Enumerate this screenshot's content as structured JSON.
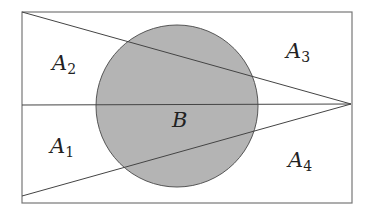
{
  "diagram": {
    "type": "geometric-region-partition",
    "colors": {
      "background": "#ffffff",
      "stroke": "#444444",
      "rect_stroke": "#777777",
      "circle_fill": "#b4b4b4",
      "circle_stroke": "#555555",
      "text": "#222222"
    },
    "rectangle": {
      "x": 22,
      "y": 12,
      "width": 330,
      "height": 191
    },
    "circle": {
      "cx": 177,
      "cy": 106,
      "r": 81
    },
    "apex": {
      "x": 351,
      "y": 104
    },
    "lines": [
      {
        "name": "upper-diagonal",
        "x1": 22,
        "y1": 12,
        "x2": 351,
        "y2": 104
      },
      {
        "name": "horizontal-midline",
        "x1": 22,
        "y1": 105,
        "x2": 351,
        "y2": 104
      },
      {
        "name": "lower-diagonal",
        "x1": 22,
        "y1": 196,
        "x2": 351,
        "y2": 104
      }
    ],
    "labels": {
      "A2": {
        "main": "A",
        "sub": "2",
        "x": 52,
        "y": 70
      },
      "A3": {
        "main": "A",
        "sub": "3",
        "x": 286,
        "y": 58
      },
      "A1": {
        "main": "A",
        "sub": "1",
        "x": 50,
        "y": 153
      },
      "A4": {
        "main": "A",
        "sub": "4",
        "x": 288,
        "y": 167
      },
      "B": {
        "main": "B",
        "x": 172,
        "y": 127
      }
    }
  }
}
